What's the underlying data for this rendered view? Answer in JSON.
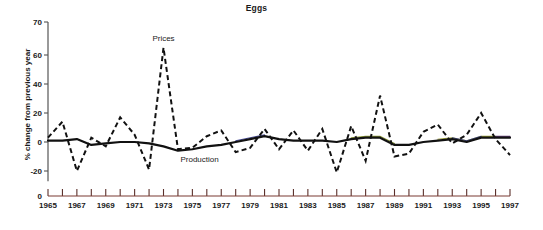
{
  "chart_data": {
    "type": "line",
    "title": "Eggs",
    "xlabel": "",
    "ylabel": "% change from previous year",
    "xlim": [
      1965,
      1997
    ],
    "ylim": [
      -30,
      70
    ],
    "yticks": [
      -20,
      0,
      20,
      40,
      60,
      70
    ],
    "ytick_labels": [
      "-20",
      "0",
      "20",
      "40",
      "60",
      "70"
    ],
    "baseline_tick_label": "0",
    "xticks": [
      1965,
      1966,
      1967,
      1968,
      1969,
      1970,
      1971,
      1972,
      1973,
      1974,
      1975,
      1976,
      1977,
      1978,
      1979,
      1980,
      1981,
      1982,
      1983,
      1984,
      1985,
      1986,
      1987,
      1988,
      1989,
      1990,
      1991,
      1992,
      1993,
      1994,
      1995,
      1996,
      1997
    ],
    "xtick_labels": [
      "1965",
      "1967",
      "1969",
      "1971",
      "1973",
      "1975",
      "1977",
      "1979",
      "1981",
      "1983",
      "1985",
      "1987",
      "1989",
      "1991",
      "1993",
      "1995",
      "1997"
    ],
    "xtick_label_years": [
      1965,
      1967,
      1969,
      1971,
      1973,
      1975,
      1977,
      1979,
      1981,
      1983,
      1985,
      1987,
      1989,
      1991,
      1993,
      1995,
      1997
    ],
    "grid": false,
    "legend_position": "inline-annotations",
    "annotations": [
      {
        "text": "Prices",
        "x": 1973,
        "y": 70
      },
      {
        "text": "Production",
        "x": 1975.5,
        "y": -14
      }
    ],
    "x": [
      1965,
      1966,
      1967,
      1968,
      1969,
      1970,
      1971,
      1972,
      1973,
      1974,
      1975,
      1976,
      1977,
      1978,
      1979,
      1980,
      1981,
      1982,
      1983,
      1984,
      1985,
      1986,
      1987,
      1988,
      1989,
      1990,
      1991,
      1992,
      1993,
      1994,
      1995,
      1996,
      1997
    ],
    "series": [
      {
        "name": "Prices",
        "style": "dashed",
        "color": "#111111",
        "values": [
          3,
          14,
          -20,
          3,
          -3,
          17,
          5,
          -19,
          65,
          -5,
          -4,
          4,
          8,
          -7,
          -4,
          9,
          -5,
          8,
          -6,
          9,
          -21,
          11,
          -13,
          32,
          -10,
          -8,
          7,
          12,
          -1,
          5,
          20,
          2,
          -9
        ]
      },
      {
        "name": "Production",
        "style": "solid",
        "color": "#111111",
        "values": [
          1,
          1,
          2,
          -2,
          -1,
          0,
          0,
          -1,
          -3,
          -6,
          -5,
          -3,
          -2,
          0,
          2,
          4,
          2,
          1,
          1,
          1,
          0,
          2,
          3,
          3,
          -2,
          -2,
          0,
          1,
          2,
          0,
          3,
          3,
          3
        ]
      }
    ]
  }
}
